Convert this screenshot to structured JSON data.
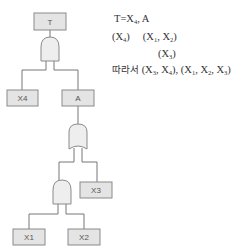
{
  "diagram": {
    "type": "fault-tree",
    "colors": {
      "box_fill": "#e4e4e4",
      "box_stroke": "#8a8a8a",
      "line": "#777777",
      "gate_fill": "#eeeeee"
    },
    "nodes": {
      "top": {
        "label": "T"
      },
      "gate1": {
        "type": "AND"
      },
      "x4": {
        "label": "X4"
      },
      "a": {
        "label": "A"
      },
      "gate2": {
        "type": "OR"
      },
      "gate3": {
        "type": "AND"
      },
      "x3": {
        "label": "X3"
      },
      "x1": {
        "label": "X1"
      },
      "x2": {
        "label": "X2"
      }
    }
  },
  "notes": {
    "line1": {
      "lhs": "T",
      "eq": "=",
      "x": "X",
      "x_sub": "4",
      "rest": ", A"
    },
    "line2": {
      "a_open": "(X",
      "a_sub": "4",
      "a_close": ")",
      "b_open": "(X",
      "b_sub1": "1",
      "b_mid": ", X",
      "b_sub2": "2",
      "b_close": ")"
    },
    "line3": {
      "open": "(X",
      "sub": "3",
      "close": ")"
    },
    "line4": {
      "prefix": "따라서",
      "s1_open": "(X",
      "s1_sub1": "3",
      "s1_mid": ", X",
      "s1_sub2": "4",
      "s1_close": "),",
      "s2_open": "(X",
      "s2_sub1": "1",
      "s2_mid1": ", X",
      "s2_sub2": "2",
      "s2_mid2": ", X",
      "s2_sub3": "3",
      "s2_close": ")"
    }
  }
}
